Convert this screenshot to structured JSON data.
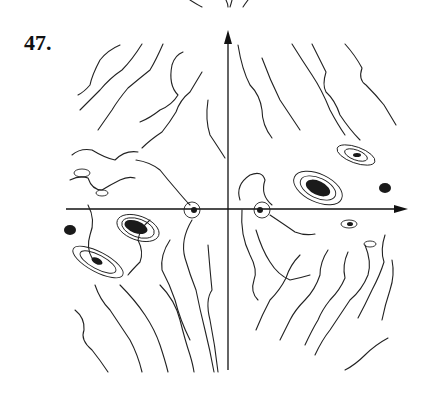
{
  "figure": {
    "label": "47.",
    "type": "phase portrait",
    "axes": {
      "horizontal": "x-axis with right arrow",
      "vertical": "y-axis with up arrow"
    }
  }
}
